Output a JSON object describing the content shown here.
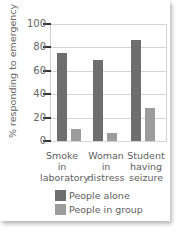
{
  "chart_data": {
    "type": "bar",
    "title": "",
    "xlabel": "",
    "ylabel": "% responding to emergency",
    "ylim": [
      0,
      100
    ],
    "yticks": [
      0,
      20,
      40,
      60,
      80,
      100
    ],
    "grid": true,
    "legend_position": "bottom",
    "categories": [
      "Smoke in laboratory",
      "Woman in distress",
      "Student having seizure"
    ],
    "category_lines": [
      [
        "Smoke",
        "in",
        "laboratory"
      ],
      [
        "Woman",
        "in",
        "distress"
      ],
      [
        "Student",
        "having",
        "seizure"
      ]
    ],
    "series": [
      {
        "name": "People alone",
        "color": "#6e6e6e",
        "values": [
          75,
          69,
          86
        ]
      },
      {
        "name": "People in group",
        "color": "#9c9c9c",
        "values": [
          10,
          7,
          28
        ]
      }
    ]
  },
  "axis": {
    "ylabel": "% responding to emergency",
    "ticks": [
      "100",
      "80",
      "60",
      "40",
      "20",
      "0"
    ]
  },
  "legend": {
    "items": [
      {
        "label": "People alone",
        "color": "#6e6e6e"
      },
      {
        "label": "People in group",
        "color": "#9c9c9c"
      }
    ]
  }
}
